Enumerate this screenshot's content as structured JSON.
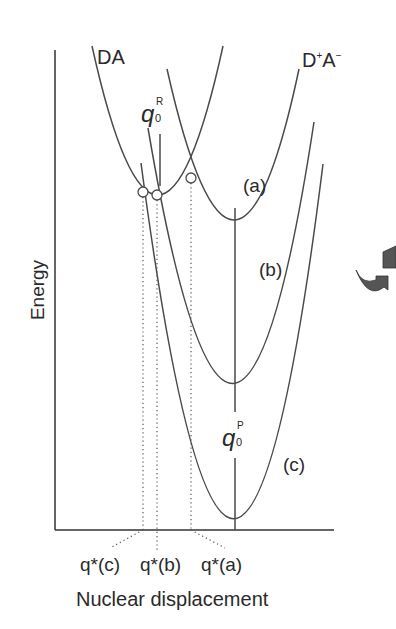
{
  "figure": {
    "curve_labels": {
      "reactant": "DA",
      "product_base": "D",
      "product_sup_plus": "+",
      "product_mid": "A",
      "product_sup_minus": "−",
      "a": "(a)",
      "b": "(b)",
      "c": "(c)"
    },
    "markers": {
      "q0R_main": "q",
      "q0R_sub": "0",
      "q0R_sup": "R",
      "q0P_main": "q",
      "q0P_sub": "0",
      "q0P_sup": "P"
    },
    "axes": {
      "ylabel": "Energy",
      "xlabel": "Nuclear displacement"
    },
    "crossing_labels": {
      "c": "q*(c)",
      "b": "q*(b)",
      "a": "q*(a)"
    },
    "colors": {
      "line": "#4a4a4a",
      "text": "#2a2a2a",
      "icon": "#555555"
    },
    "icon": "rotate-arrows-icon"
  }
}
